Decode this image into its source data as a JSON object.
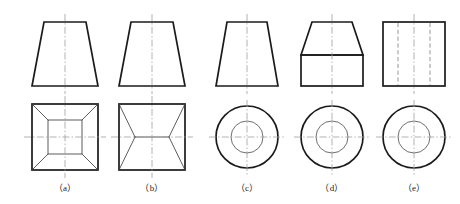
{
  "figure": {
    "type": "engineering-orthographic-projection-exercise",
    "background_color": "#ffffff",
    "line_color": "#1b1b1b",
    "centerline_color": "#9a9a9a",
    "hidden_line_color": "#8c8c8c",
    "thin_line_color": "#5a5a5a",
    "width": 460,
    "height": 204
  },
  "columns": [
    {
      "id": "a",
      "caption": "（a）",
      "center_x": 65,
      "front_view": {
        "shape": "trapezoid",
        "description": "truncated-pyramid-front-view",
        "top_y": 22,
        "bottom_y": 86,
        "top_half_width": 21,
        "bottom_half_width": 33
      },
      "bottom_view": {
        "shape": "square-with-inner-square-and-corner-diagonals",
        "description": "truncated-pyramid-top-view",
        "outer_half": 33,
        "inner_half": 17,
        "center_y": 137
      }
    },
    {
      "id": "b",
      "caption": "（b）",
      "center_x": 152,
      "front_view": {
        "shape": "trapezoid",
        "description": "wedge-roof-front-view",
        "top_y": 22,
        "bottom_y": 86,
        "top_half_width": 21,
        "bottom_half_width": 33
      },
      "bottom_view": {
        "shape": "square-with-ridge-line-and-corner-diagonals",
        "description": "wedge-roof-top-view",
        "outer_half": 33,
        "ridge_half": 17,
        "center_y": 137
      }
    },
    {
      "id": "c",
      "caption": "（c）",
      "center_x": 247,
      "front_view": {
        "shape": "trapezoid",
        "description": "truncated-cone-front-view",
        "top_y": 22,
        "bottom_y": 86,
        "top_half_width": 20,
        "bottom_half_width": 31
      },
      "bottom_view": {
        "shape": "two-concentric-circles",
        "description": "truncated-cone-top-view",
        "outer_radius": 31,
        "inner_radius": 16,
        "center_y": 137
      }
    },
    {
      "id": "d",
      "caption": "（d）",
      "center_x": 332,
      "front_view": {
        "shape": "trapezoid-over-rectangle",
        "description": "chamfered-cylinder-front-view",
        "top_y": 22,
        "junction_y": 55,
        "bottom_y": 86,
        "top_half_width": 20,
        "bottom_half_width": 31
      },
      "bottom_view": {
        "shape": "two-concentric-circles",
        "description": "chamfered-cylinder-top-view",
        "outer_radius": 31,
        "inner_radius": 16,
        "center_y": 137
      }
    },
    {
      "id": "e",
      "caption": "（e）",
      "center_x": 414,
      "front_view": {
        "shape": "rectangle-with-two-hidden-lines",
        "description": "hollow-cylinder-front-view",
        "top_y": 22,
        "bottom_y": 86,
        "half_width": 31,
        "hidden_line_offset": 16
      },
      "bottom_view": {
        "shape": "two-concentric-circles",
        "description": "hollow-cylinder-top-view",
        "outer_radius": 31,
        "inner_radius": 16,
        "center_y": 137
      }
    }
  ]
}
